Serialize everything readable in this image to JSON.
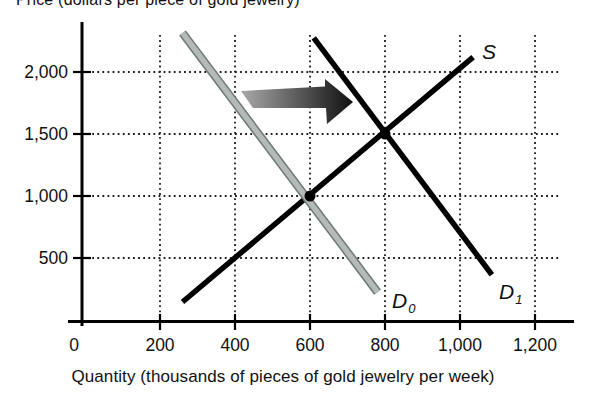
{
  "figure": {
    "y_axis_title": "Price (dollars per piece of gold jewelry)",
    "x_axis_title": "Quantity (thousands of pieces of gold jewelry per week)"
  },
  "colors": {
    "curve_black": "#000000",
    "d0_fill": "#b4bab8",
    "d0_edge": "#6f7878",
    "arrow_from": "#a8a8a8",
    "arrow_to": "#101010",
    "grid": "#1c1c1c"
  },
  "chart_data": {
    "type": "line",
    "title": "",
    "xlabel": "Quantity (thousands of pieces of gold jewelry per week)",
    "ylabel": "Price (dollars per piece of gold jewelry)",
    "xlim": [
      0,
      1300
    ],
    "ylim": [
      0,
      2400
    ],
    "grid": true,
    "x_ticks": [
      0,
      200,
      400,
      600,
      800,
      1000,
      1200
    ],
    "x_tick_labels": [
      "0",
      "200",
      "400",
      "600",
      "800",
      "1,000",
      "1,200"
    ],
    "y_ticks": [
      500,
      1000,
      1500,
      2000
    ],
    "y_tick_labels": [
      "500",
      "1,000",
      "1,500",
      "2,000"
    ],
    "series": [
      {
        "name": "supply",
        "label": "S",
        "label_sub": "",
        "color": "#000000",
        "points": [
          [
            260,
            145
          ],
          [
            1035,
            2120
          ]
        ]
      },
      {
        "name": "demand-initial",
        "label": "D",
        "label_sub": "0",
        "color": "#b4bab8",
        "points": [
          [
            260,
            2315
          ],
          [
            780,
            225
          ]
        ]
      },
      {
        "name": "demand-new",
        "label": "D",
        "label_sub": "1",
        "color": "#000000",
        "points": [
          [
            610,
            2275
          ],
          [
            1085,
            365
          ]
        ]
      }
    ],
    "equilibrium_points": [
      [
        600,
        1000
      ],
      [
        800,
        1500
      ]
    ],
    "annotations": [
      {
        "type": "shift-arrow",
        "direction": "right",
        "from": "D0",
        "to": "D1"
      }
    ]
  }
}
